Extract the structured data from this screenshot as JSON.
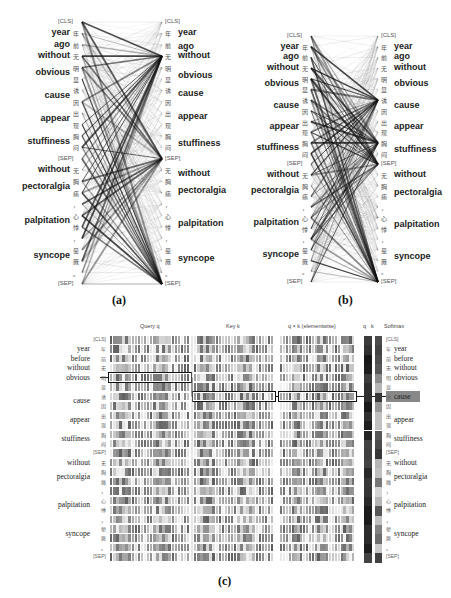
{
  "panel_a": {
    "caption": "(a)",
    "left_tokens": [
      "[CLS]",
      "年",
      "前",
      "无",
      "明",
      "显",
      "诱",
      "因",
      "出",
      "现",
      "胸",
      "闷",
      "[SEP]",
      "无",
      "胸",
      "痛",
      "，",
      "心",
      "悸",
      "，",
      "晕",
      "厥",
      "。",
      "[SEP]"
    ],
    "right_tokens": [
      "[CLS]",
      "年",
      "前",
      "无",
      "明",
      "显",
      "诱",
      "因",
      "出",
      "现",
      "胸",
      "闷",
      "[SEP]",
      "无",
      "胸",
      "痛",
      "，",
      "心",
      "悸",
      "，",
      "晕",
      "厥",
      "。",
      "[SEP]"
    ],
    "left_words": [
      {
        "text": "year",
        "row": 1
      },
      {
        "text": "ago",
        "row": 2
      },
      {
        "text": "without",
        "row": 3
      },
      {
        "text": "obvious",
        "row": 4.5
      },
      {
        "text": "cause",
        "row": 6.5
      },
      {
        "text": "appear",
        "row": 8.5
      },
      {
        "text": "stuffiness",
        "row": 10.5
      },
      {
        "text": "without",
        "row": 13
      },
      {
        "text": "pectoralgia",
        "row": 14.5
      },
      {
        "text": "palpitation",
        "row": 17.5
      },
      {
        "text": "syncope",
        "row": 20.5
      }
    ],
    "right_words": [
      {
        "text": "year",
        "row": 1
      },
      {
        "text": "ago",
        "row": 2.2
      },
      {
        "text": "without",
        "row": 3
      },
      {
        "text": "obvious",
        "row": 4.7
      },
      {
        "text": "cause",
        "row": 6.3
      },
      {
        "text": "appear",
        "row": 8.3
      },
      {
        "text": "stuffiness",
        "row": 10.7
      },
      {
        "text": "without",
        "row": 13.3
      },
      {
        "text": "pectoralgia",
        "row": 14.8
      },
      {
        "text": "palpitation",
        "row": 17.7
      },
      {
        "text": "syncope",
        "row": 20.8
      }
    ]
  },
  "panel_b": {
    "caption": "(b)",
    "left_tokens": [
      "[CLS]",
      "年",
      "前",
      "无",
      "明",
      "显",
      "诱",
      "因",
      "出",
      "现",
      "胸",
      "闷",
      "[SEP]",
      "无",
      "胸",
      "痛",
      "，",
      "心",
      "悸",
      "，",
      "晕",
      "厥",
      "。",
      "[SEP]"
    ],
    "right_tokens": [
      "[CLS]",
      "年",
      "前",
      "无",
      "明",
      "显",
      "诱",
      "因",
      "出",
      "现",
      "胸",
      "闷",
      "[SEP]",
      "无",
      "胸",
      "痛",
      "，",
      "心",
      "悸",
      "，",
      "晕",
      "厥",
      "。",
      "[SEP]"
    ],
    "left_words": [
      {
        "text": "year",
        "row": 1
      },
      {
        "text": "ago",
        "row": 2
      },
      {
        "text": "without",
        "row": 3
      },
      {
        "text": "obvious",
        "row": 4.5
      },
      {
        "text": "cause",
        "row": 6.5
      },
      {
        "text": "appear",
        "row": 8.5
      },
      {
        "text": "stuffiness",
        "row": 10.5
      },
      {
        "text": "without",
        "row": 13
      },
      {
        "text": "pectoralgia",
        "row": 14.5
      },
      {
        "text": "palpitation",
        "row": 17.5
      },
      {
        "text": "syncope",
        "row": 20.5
      }
    ],
    "right_words": [
      {
        "text": "year",
        "row": 1
      },
      {
        "text": "ago",
        "row": 2
      },
      {
        "text": "without",
        "row": 3
      },
      {
        "text": "obvious",
        "row": 4.5
      },
      {
        "text": "cause",
        "row": 6.5
      },
      {
        "text": "appear",
        "row": 8.5
      },
      {
        "text": "stuffiness",
        "row": 10.7
      },
      {
        "text": "without",
        "row": 13
      },
      {
        "text": "pectoralgia",
        "row": 14.7
      },
      {
        "text": "palpitation",
        "row": 17.7
      },
      {
        "text": "syncope",
        "row": 20.7
      }
    ]
  },
  "panel_c": {
    "caption": "(c)",
    "headers": {
      "query": "Query q",
      "key": "Key k",
      "qk": "q × k (elementwise)",
      "q": "q",
      "k": "k",
      "softmax": "Softmax"
    },
    "tokens": [
      "[CLS]",
      "年",
      "前",
      "无",
      "明",
      "显",
      "诱",
      "因",
      "出",
      "现",
      "胸",
      "闷",
      "[SEP]",
      "无",
      "胸",
      "痛",
      "，",
      "心",
      "悸",
      "，",
      "晕",
      "厥",
      "。",
      "[SEP]"
    ],
    "left_words": [
      {
        "text": "year",
        "row": 1
      },
      {
        "text": "before",
        "row": 2
      },
      {
        "text": "without",
        "row": 3
      },
      {
        "text": "obvious",
        "row": 4
      },
      {
        "text": "cause",
        "row": 6.5
      },
      {
        "text": "appear",
        "row": 8.5
      },
      {
        "text": "stuffiness",
        "row": 10.5
      },
      {
        "text": "without",
        "row": 13
      },
      {
        "text": "pectoralgia",
        "row": 14.5
      },
      {
        "text": "palpitation",
        "row": 17.5
      },
      {
        "text": "syncope",
        "row": 20.5
      }
    ],
    "right_words": [
      {
        "text": "year",
        "row": 1
      },
      {
        "text": "before",
        "row": 2
      },
      {
        "text": "without",
        "row": 3
      },
      {
        "text": "obvious",
        "row": 4
      },
      {
        "text": "cause",
        "row": 6
      },
      {
        "text": "appear",
        "row": 8.5
      },
      {
        "text": "stuffiness",
        "row": 10.5
      },
      {
        "text": "without",
        "row": 13
      },
      {
        "text": "pectoralgia",
        "row": 14.5
      },
      {
        "text": "palpitation",
        "row": 17.5
      },
      {
        "text": "syncope",
        "row": 20.5
      }
    ],
    "highlight_query_row": 4,
    "highlight_key_row": 6,
    "softmax_values": [
      0.85,
      0.9,
      0.85,
      0.8,
      0.55,
      0.35,
      0.95,
      0.5,
      0.3,
      0.3,
      0.8,
      0.85,
      0.95,
      0.35,
      0.3,
      0.65,
      0.2,
      0.35,
      0.8,
      0.3,
      0.6,
      0.7,
      0.25,
      0.9
    ]
  }
}
